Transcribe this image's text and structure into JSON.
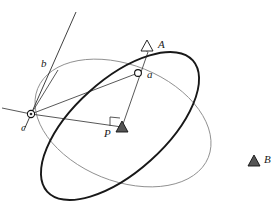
{
  "figure": {
    "width": 279,
    "height": 214,
    "background_color": "#ffffff",
    "stroke_colors": {
      "thick_circle": "#181818",
      "thin_circle": "#8a8a8a",
      "ray": "#3a3a3a",
      "label": "#1a1a1a",
      "station_fill": "#555555"
    }
  },
  "labels": {
    "A": "A",
    "B": "B",
    "P": "P",
    "a": "a",
    "b": "b",
    "c": "c"
  },
  "points": {
    "A": {
      "label": "A",
      "marker": "triangle-open",
      "x": 147,
      "y": 46,
      "label_x": 158,
      "label_y": 45
    },
    "B": {
      "label": "B",
      "marker": "triangle-filled",
      "x": 254,
      "y": 161,
      "label_x": 264,
      "label_y": 160
    },
    "P": {
      "label": "P",
      "marker": "triangle-filled",
      "x": 122,
      "y": 128,
      "label_x": 107,
      "label_y": 135
    },
    "a": {
      "label": "a",
      "marker": "ring",
      "x": 138,
      "y": 73,
      "label_x": 147,
      "label_y": 77
    },
    "b": {
      "label": "b",
      "marker": "none",
      "x": 58,
      "y": 70,
      "label_x": 44,
      "label_y": 64
    },
    "c": {
      "label": "c",
      "marker": "ring-cross",
      "x": 31,
      "y": 114,
      "label_x": 24,
      "label_y": 128
    }
  },
  "curves": {
    "thick_circle": {
      "name": "dangerous-circle",
      "style": "thick",
      "cx": 120,
      "cy": 126,
      "rx": 98,
      "ry": 46,
      "rotation_deg": -42
    },
    "thin_circle": {
      "name": "secondary-circle",
      "style": "thin",
      "cx": 123,
      "cy": 123,
      "rx": 92,
      "ry": 58,
      "rotation_deg": 22
    }
  },
  "rays": [
    {
      "name": "line-through-b-to-c",
      "x1": 76,
      "y1": 12,
      "x2": 24,
      "y2": 130
    },
    {
      "name": "line-A-a-P",
      "x1": 148,
      "y1": 52,
      "x2": 122,
      "y2": 127
    },
    {
      "name": "line-c-to-P",
      "x1": 31,
      "y1": 114,
      "x2": 122,
      "y2": 127
    },
    {
      "name": "line-c-extend-left",
      "x1": 31,
      "y1": 114,
      "x2": 2,
      "y2": 108
    },
    {
      "name": "line-c-to-b",
      "x1": 31,
      "y1": 114,
      "x2": 58,
      "y2": 70
    },
    {
      "name": "line-c-to-a",
      "x1": 31,
      "y1": 114,
      "x2": 138,
      "y2": 73
    }
  ],
  "right_angle": {
    "name": "right-angle-mark-at-P",
    "x": 110,
    "y": 117,
    "size": 10
  }
}
